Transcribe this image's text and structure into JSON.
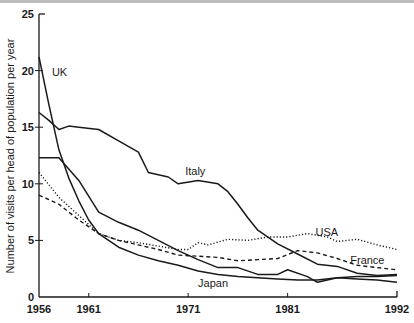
{
  "chart_data": {
    "type": "line",
    "title": "",
    "xlabel": "",
    "ylabel": "Number of visits per head of population per year",
    "xlim": [
      1956,
      1992
    ],
    "ylim": [
      0,
      25
    ],
    "x_ticks": [
      1956,
      1961,
      1971,
      1981,
      1992
    ],
    "y_ticks": [
      0,
      5,
      10,
      15,
      20,
      25
    ],
    "grid": false,
    "legend": "inline labels",
    "series": [
      {
        "name": "UK",
        "style": "solid",
        "label_pos": [
          1957.3,
          19.5
        ],
        "points": [
          [
            1956,
            21.2
          ],
          [
            1957,
            17.0
          ],
          [
            1958,
            13.0
          ],
          [
            1959,
            10.5
          ],
          [
            1960,
            8.5
          ],
          [
            1961,
            6.8
          ],
          [
            1962,
            5.6
          ],
          [
            1964,
            4.4
          ],
          [
            1966,
            3.7
          ],
          [
            1968,
            3.2
          ],
          [
            1970,
            2.8
          ],
          [
            1972,
            2.3
          ],
          [
            1974,
            2.0
          ],
          [
            1976,
            1.8
          ],
          [
            1978,
            1.7
          ],
          [
            1980,
            1.6
          ],
          [
            1982,
            1.5
          ],
          [
            1984,
            1.5
          ],
          [
            1986,
            1.7
          ],
          [
            1988,
            1.8
          ],
          [
            1990,
            1.8
          ],
          [
            1992,
            1.9
          ]
        ]
      },
      {
        "name": "Italy",
        "style": "solid",
        "label_pos": [
          1970.7,
          10.8
        ],
        "points": [
          [
            1956,
            16.3
          ],
          [
            1957,
            15.6
          ],
          [
            1958,
            14.8
          ],
          [
            1959,
            15.1
          ],
          [
            1960,
            15.0
          ],
          [
            1962,
            14.8
          ],
          [
            1964,
            13.8
          ],
          [
            1966,
            12.8
          ],
          [
            1967,
            11.0
          ],
          [
            1969,
            10.6
          ],
          [
            1970,
            10.0
          ],
          [
            1972,
            10.3
          ],
          [
            1974,
            10.0
          ],
          [
            1975,
            9.3
          ],
          [
            1976,
            8.2
          ],
          [
            1977,
            7.0
          ],
          [
            1978,
            5.9
          ],
          [
            1980,
            4.7
          ],
          [
            1982,
            3.8
          ],
          [
            1984,
            2.9
          ],
          [
            1986,
            2.7
          ],
          [
            1988,
            2.1
          ],
          [
            1990,
            1.9
          ],
          [
            1992,
            2.0
          ]
        ]
      },
      {
        "name": "Japan",
        "style": "solid",
        "label_pos": [
          1972.0,
          0.9
        ],
        "points": [
          [
            1956,
            12.3
          ],
          [
            1958,
            12.3
          ],
          [
            1960,
            10.3
          ],
          [
            1962,
            7.5
          ],
          [
            1964,
            6.6
          ],
          [
            1966,
            5.9
          ],
          [
            1968,
            5.0
          ],
          [
            1970,
            4.1
          ],
          [
            1972,
            3.3
          ],
          [
            1974,
            2.6
          ],
          [
            1976,
            2.6
          ],
          [
            1978,
            2.0
          ],
          [
            1980,
            2.0
          ],
          [
            1981,
            2.4
          ],
          [
            1983,
            1.8
          ],
          [
            1984,
            1.3
          ],
          [
            1986,
            1.7
          ],
          [
            1988,
            1.6
          ],
          [
            1990,
            1.5
          ],
          [
            1992,
            1.3
          ]
        ]
      },
      {
        "name": "USA",
        "style": "dotted",
        "label_pos": [
          1983.8,
          5.4
        ],
        "points": [
          [
            1956,
            11.0
          ],
          [
            1958,
            8.8
          ],
          [
            1960,
            7.2
          ],
          [
            1962,
            5.6
          ],
          [
            1964,
            5.0
          ],
          [
            1966,
            4.8
          ],
          [
            1968,
            4.5
          ],
          [
            1970,
            4.2
          ],
          [
            1971,
            4.2
          ],
          [
            1972,
            4.8
          ],
          [
            1973,
            4.6
          ],
          [
            1975,
            5.1
          ],
          [
            1977,
            5.0
          ],
          [
            1979,
            5.3
          ],
          [
            1981,
            5.3
          ],
          [
            1983,
            5.6
          ],
          [
            1985,
            5.3
          ],
          [
            1986,
            4.9
          ],
          [
            1988,
            5.1
          ],
          [
            1990,
            4.6
          ],
          [
            1992,
            4.2
          ]
        ]
      },
      {
        "name": "France",
        "style": "dashed",
        "label_pos": [
          1987.3,
          2.9
        ],
        "points": [
          [
            1956,
            9.0
          ],
          [
            1958,
            8.2
          ],
          [
            1960,
            6.8
          ],
          [
            1962,
            5.6
          ],
          [
            1964,
            5.0
          ],
          [
            1966,
            4.6
          ],
          [
            1968,
            4.2
          ],
          [
            1970,
            3.7
          ],
          [
            1972,
            3.6
          ],
          [
            1974,
            3.5
          ],
          [
            1976,
            3.2
          ],
          [
            1978,
            3.3
          ],
          [
            1980,
            3.4
          ],
          [
            1982,
            4.1
          ],
          [
            1984,
            3.9
          ],
          [
            1986,
            3.4
          ],
          [
            1988,
            2.8
          ],
          [
            1990,
            2.6
          ],
          [
            1992,
            2.4
          ]
        ]
      }
    ]
  },
  "colors": {
    "line": "#1a1a1a",
    "background": "#ffffff"
  }
}
